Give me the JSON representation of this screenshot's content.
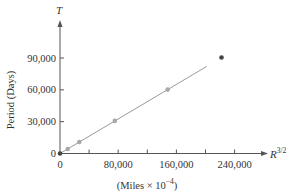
{
  "chart_data": {
    "type": "scatter",
    "title": "",
    "xlabel": "(Miles × 10⁻⁴)",
    "x_axis_variable": "R",
    "x_axis_variable_exponent": "3/2",
    "ylabel": "Period (Days)",
    "y_axis_variable": "T",
    "xlim": [
      0,
      280000
    ],
    "ylim": [
      0,
      120000
    ],
    "x_ticks": [
      0,
      40000,
      80000,
      120000,
      160000,
      200000,
      240000
    ],
    "x_tick_labels": [
      "0",
      "80,000",
      "160,000",
      "240,000"
    ],
    "x_tick_label_values": [
      0,
      80000,
      160000,
      240000
    ],
    "y_ticks": [
      0,
      30000,
      60000,
      90000
    ],
    "y_tick_labels": [
      "0",
      "30,000",
      "60,000",
      "90,000"
    ],
    "grid": false,
    "legend": null,
    "series": [
      {
        "name": "data points",
        "x": [
          0,
          10600,
          26500,
          75400,
          148000,
          222000
        ],
        "y": [
          0,
          4300,
          10800,
          30700,
          60200,
          90500
        ],
        "highlighted_indices": [
          0,
          5
        ]
      }
    ],
    "fit_line": {
      "type": "linear",
      "slope": 0.407,
      "intercept": 0,
      "x_range": [
        0,
        280000
      ]
    }
  },
  "labels": {
    "y_var": "T",
    "x_var": "R",
    "x_var_exp": "3/2",
    "y_title": "Period (Days)",
    "x_units": "(Miles × 10",
    "x_units_exp": "−4",
    "x_units_close": ")"
  },
  "colors": {
    "axis": "#555555",
    "line": "#9a9a9a",
    "point": "#a8a8a8",
    "point_highlight": "#444444"
  }
}
